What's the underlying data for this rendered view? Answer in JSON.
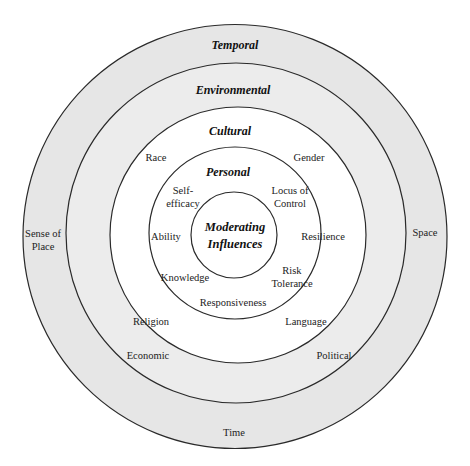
{
  "diagram": {
    "colors": {
      "outer_rings_fill": "#e6e6e6",
      "inner_rings_fill": "#ffffff",
      "stroke": "#2a2a2a"
    },
    "rings": [
      {
        "name": "Temporal",
        "items": [
          "Sense of Place",
          "Space",
          "Time"
        ]
      },
      {
        "name": "Environmental",
        "items": [
          "Economic",
          "Political"
        ]
      },
      {
        "name": "Cultural",
        "items": [
          "Race",
          "Gender",
          "Religion",
          "Language"
        ]
      },
      {
        "name": "Personal",
        "items": [
          "Self-efficacy",
          "Locus of Control",
          "Ability",
          "Resilience",
          "Knowledge",
          "Risk Tolerance",
          "Responsiveness"
        ]
      }
    ],
    "center": {
      "line1": "Moderating",
      "line2": "Influences"
    },
    "labels": {
      "temporal": "Temporal",
      "environmental": "Environmental",
      "cultural": "Cultural",
      "personal": "Personal",
      "sense_of_place_1": "Sense of",
      "sense_of_place_2": "Place",
      "space": "Space",
      "time": "Time",
      "economic": "Economic",
      "political": "Political",
      "race": "Race",
      "gender": "Gender",
      "religion": "Religion",
      "language": "Language",
      "self_efficacy_1": "Self-",
      "self_efficacy_2": "efficacy",
      "locus_1": "Locus of",
      "locus_2": "Control",
      "ability": "Ability",
      "resilience": "Resilience",
      "knowledge": "Knowledge",
      "risk_1": "Risk",
      "risk_2": "Tolerance",
      "responsiveness": "Responsiveness"
    }
  }
}
